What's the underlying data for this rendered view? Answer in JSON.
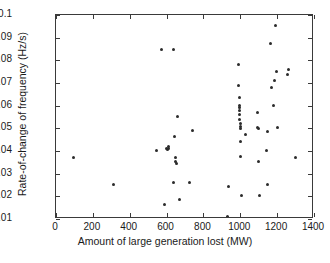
{
  "chart_data": {
    "type": "scatter",
    "title": "",
    "xlabel": "Amount of large generation lost (MW)",
    "ylabel": "Rate-of-change of frequency (Hz/s)",
    "xlim": [
      0,
      1400
    ],
    "ylim": [
      0.01,
      0.1
    ],
    "xticks": [
      0,
      200,
      400,
      600,
      800,
      1000,
      1200,
      1400
    ],
    "xtick_labels": [
      "0",
      "200",
      "400",
      "600",
      "800",
      "1000",
      "1200",
      "1400"
    ],
    "yticks": [
      0.01,
      0.02,
      0.03,
      0.04,
      0.05,
      0.06,
      0.07,
      0.08,
      0.09,
      0.1
    ],
    "ytick_labels": [
      "0.01",
      "0.02",
      "0.03",
      "0.04",
      "0.05",
      "0.06",
      "0.07",
      "0.08",
      "0.09",
      "0.1"
    ],
    "grid": false,
    "legend": null,
    "marker": "dot",
    "marker_color": "#2b2b2b",
    "series": [
      {
        "name": "events",
        "points": [
          [
            97,
            0.0372
          ],
          [
            310,
            0.0251
          ],
          [
            545,
            0.0403
          ],
          [
            575,
            0.085
          ],
          [
            588,
            0.0163
          ],
          [
            598,
            0.0413
          ],
          [
            604,
            0.0407
          ],
          [
            608,
            0.0418
          ],
          [
            612,
            0.041
          ],
          [
            638,
            0.085
          ],
          [
            640,
            0.026
          ],
          [
            645,
            0.0462
          ],
          [
            648,
            0.0372
          ],
          [
            650,
            0.0352
          ],
          [
            652,
            0.0345
          ],
          [
            660,
            0.0551
          ],
          [
            668,
            0.0184
          ],
          [
            722,
            0.0261
          ],
          [
            742,
            0.0491
          ],
          [
            930,
            0.0112
          ],
          [
            935,
            0.0243
          ],
          [
            990,
            0.0782
          ],
          [
            992,
            0.0691
          ],
          [
            993,
            0.0637
          ],
          [
            994,
            0.06
          ],
          [
            995,
            0.0592
          ],
          [
            996,
            0.0578
          ],
          [
            997,
            0.0562
          ],
          [
            998,
            0.054
          ],
          [
            999,
            0.0521
          ],
          [
            1000,
            0.0508
          ],
          [
            1001,
            0.0498
          ],
          [
            1002,
            0.0444
          ],
          [
            1003,
            0.0374
          ],
          [
            1004,
            0.0205
          ],
          [
            1030,
            0.0473
          ],
          [
            1092,
            0.0572
          ],
          [
            1095,
            0.0504
          ],
          [
            1098,
            0.05
          ],
          [
            1100,
            0.0355
          ],
          [
            1105,
            0.0205
          ],
          [
            1140,
            0.0404
          ],
          [
            1145,
            0.0484
          ],
          [
            1150,
            0.0253
          ],
          [
            1165,
            0.0874
          ],
          [
            1172,
            0.0681
          ],
          [
            1178,
            0.0601
          ],
          [
            1185,
            0.0713
          ],
          [
            1190,
            0.0954
          ],
          [
            1195,
            0.0752
          ],
          [
            1200,
            0.0504
          ],
          [
            1255,
            0.0737
          ],
          [
            1262,
            0.0761
          ],
          [
            1300,
            0.0373
          ]
        ]
      }
    ]
  }
}
